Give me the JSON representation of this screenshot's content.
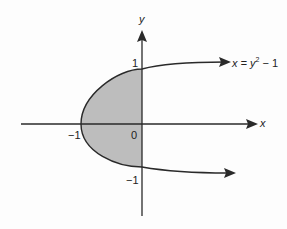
{
  "figure": {
    "axes": {
      "x_label": "x",
      "y_label": "y",
      "origin_label": "0"
    },
    "ticks": {
      "x_neg_one": "−1",
      "y_pos_one": "1",
      "y_neg_one": "−1"
    },
    "curve": {
      "equation_lhs": "x = y",
      "equation_exp": "2",
      "equation_rhs": " − 1"
    },
    "colors": {
      "axis": "#2a2a2a",
      "curve": "#2a2a2a",
      "shaded_region": "#bdbdbd"
    },
    "shaded_region": "region bounded by x = y^2 - 1 and the y-axis (x ≤ 0)"
  }
}
